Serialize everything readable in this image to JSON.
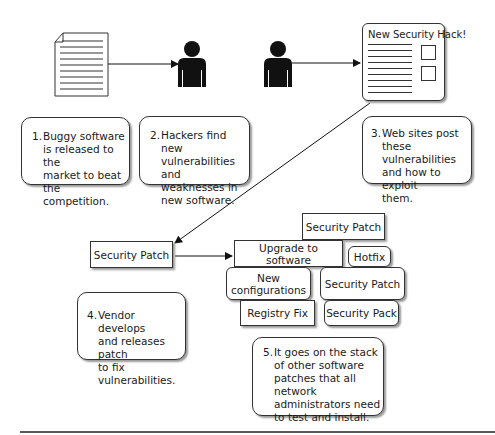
{
  "steps": [
    {
      "num": "1.",
      "text": "Buggy software\nis released to the\nmarket to beat the\ncompetition."
    },
    {
      "num": "2.",
      "text": "Hackers find new\nvulnerabilities and\nweaknesses in\nnew software."
    },
    {
      "num": "3.",
      "text": "Web sites post\nthese vulnerabilities\nand how to exploit\nthem."
    },
    {
      "num": "4.",
      "text": "Vendor develops\nand releases patch\nto fix vulnerabilities."
    },
    {
      "num": "5.",
      "text": "It goes on the stack\nof other software\npatches that all network\nadministrators need\nto test and install."
    }
  ],
  "website": {
    "title": "New Security Hack!"
  },
  "patch_box": {
    "label": "Security Patch"
  },
  "stack": {
    "security_patch_top": "Security Patch",
    "upgrade": "Upgrade to software",
    "hotfix": "Hotfix",
    "new_config": "New\nconfigurations",
    "security_patch_mid": "Security Patch",
    "registry_fix": "Registry Fix",
    "security_pack": "Security Pack"
  }
}
